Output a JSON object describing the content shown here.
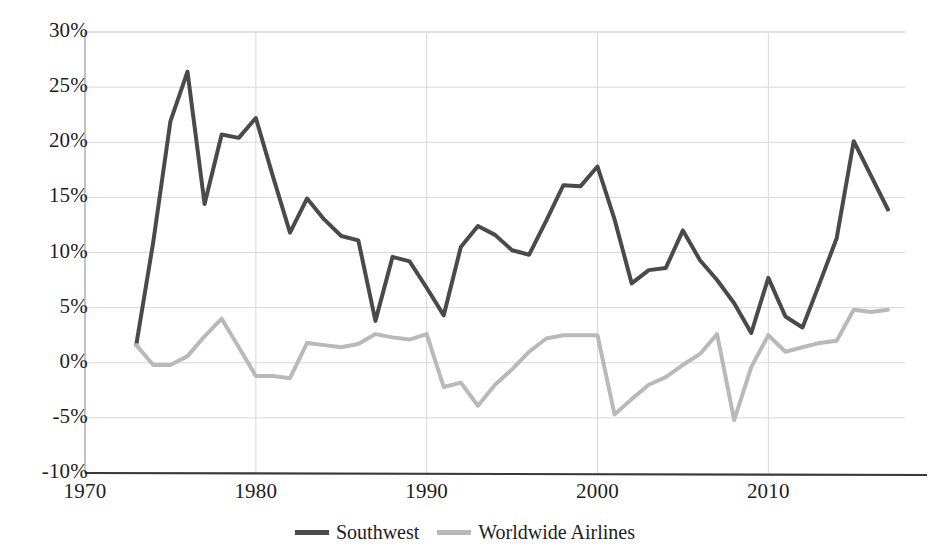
{
  "chart_data": {
    "type": "line",
    "title": "",
    "subtitle": "",
    "xlabel": "",
    "ylabel": "",
    "xlim": [
      1970,
      2018
    ],
    "ylim": [
      -10,
      30
    ],
    "grid": true,
    "grid_axis": "y",
    "legend_position": "bottom-center",
    "x_tick_labels": [
      "1970",
      "1980",
      "1990",
      "2000",
      "2010"
    ],
    "x_ticks": [
      1970,
      1980,
      1990,
      2000,
      2010
    ],
    "y_tick_labels": [
      "30%",
      "25%",
      "20%",
      "15%",
      "10%",
      "5%",
      "0%",
      "-5%",
      "-10%"
    ],
    "y_ticks": [
      30,
      25,
      20,
      15,
      10,
      5,
      0,
      -5,
      -10
    ],
    "x": [
      1973,
      1974,
      1975,
      1976,
      1977,
      1978,
      1979,
      1980,
      1981,
      1982,
      1983,
      1984,
      1985,
      1986,
      1987,
      1988,
      1989,
      1990,
      1991,
      1992,
      1993,
      1994,
      1995,
      1996,
      1997,
      1998,
      1999,
      2000,
      2001,
      2002,
      2003,
      2004,
      2005,
      2006,
      2007,
      2008,
      2009,
      2010,
      2011,
      2012,
      2013,
      2014,
      2015,
      2016,
      2017
    ],
    "series": [
      {
        "name": "Southwest",
        "color": "#4a4a4a",
        "values": [
          1.6,
          11.0,
          21.9,
          26.4,
          14.4,
          20.7,
          20.4,
          22.2,
          16.9,
          11.8,
          14.9,
          13.0,
          11.5,
          11.1,
          3.8,
          9.6,
          9.2,
          6.8,
          4.3,
          10.5,
          12.4,
          11.6,
          10.2,
          9.8,
          12.9,
          16.1,
          16.0,
          17.8,
          13.0,
          7.2,
          8.4,
          8.6,
          12.0,
          9.3,
          7.5,
          5.4,
          2.7,
          7.7,
          4.2,
          3.2,
          7.2,
          11.3,
          20.1,
          17.0,
          13.9
        ]
      },
      {
        "name": "Worldwide Airlines",
        "color": "#b9b9b9",
        "values": [
          1.6,
          -0.2,
          -0.2,
          0.6,
          2.4,
          4.0,
          1.4,
          -1.2,
          -1.2,
          -1.4,
          1.8,
          1.6,
          1.4,
          1.7,
          2.6,
          2.3,
          2.1,
          2.6,
          -2.2,
          -1.8,
          -3.9,
          -2.0,
          -0.6,
          1.0,
          2.2,
          2.5,
          2.5,
          2.5,
          -4.7,
          -3.3,
          -2.0,
          -1.3,
          -0.2,
          0.8,
          2.6,
          -5.2,
          -0.4,
          2.5,
          1.0,
          1.4,
          1.8,
          2.0,
          4.8,
          4.6,
          4.8
        ]
      }
    ]
  },
  "legend": {
    "items": [
      {
        "label": "Southwest",
        "color": "#4a4a4a"
      },
      {
        "label": "Worldwide Airlines",
        "color": "#b9b9b9"
      }
    ]
  },
  "axes": {
    "axis_color": "#3a3a3a",
    "grid_color": "#d8d8d8"
  }
}
